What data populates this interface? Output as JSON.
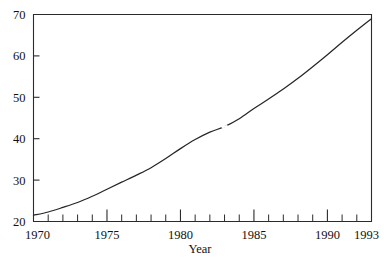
{
  "figure": {
    "clipped_top_title": "",
    "background_color": "#ffffff",
    "line_color": "#262626",
    "axis_color": "#2b2b2b",
    "text_color": "#111111"
  },
  "chart_data": {
    "type": "line",
    "title": "",
    "xlabel": "Year",
    "ylabel": "",
    "xlim": [
      1970,
      1993
    ],
    "ylim": [
      20,
      70
    ],
    "grid": false,
    "legend": null,
    "yticks": [
      20,
      30,
      40,
      50,
      60,
      70
    ],
    "ytick_labels": [
      "20",
      "30",
      "40",
      "50",
      "60",
      "70"
    ],
    "xticks": [
      1970,
      1975,
      1980,
      1985,
      1990,
      1993
    ],
    "xtick_labels": [
      "1970",
      "1975",
      "1980",
      "1985",
      "1990",
      "1993"
    ],
    "x_minor_ticks": [
      1971,
      1972,
      1973,
      1974,
      1976,
      1977,
      1978,
      1979,
      1981,
      1982,
      1983,
      1984,
      1986,
      1987,
      1988,
      1989,
      1991,
      1992
    ],
    "tick_direction": "in",
    "line_break_near_x": 1983,
    "x": [
      1970,
      1971,
      1972,
      1973,
      1974,
      1975,
      1976,
      1977,
      1978,
      1979,
      1980,
      1981,
      1982,
      1983,
      1984,
      1985,
      1986,
      1987,
      1988,
      1989,
      1990,
      1991,
      1992,
      1993
    ],
    "values": [
      21.5,
      22.3,
      23.4,
      24.6,
      26.1,
      27.8,
      29.5,
      31.2,
      33.0,
      35.2,
      37.6,
      39.8,
      41.6,
      42.9,
      44.8,
      47.3,
      49.6,
      52.0,
      54.6,
      57.4,
      60.3,
      63.3,
      66.2,
      69.0
    ]
  }
}
